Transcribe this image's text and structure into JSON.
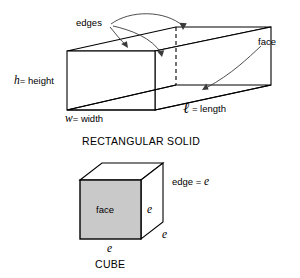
{
  "figure": {
    "colors": {
      "stroke": "#000000",
      "shaded_face": "#c9c9c9",
      "white_face": "#ffffff",
      "text": "#000000",
      "leader_line": "#3a3a3a"
    },
    "solid": {
      "title": "RECTANGULAR SOLID",
      "labels": {
        "edges": "edges",
        "face": "face",
        "height": "height",
        "height_var": "h",
        "height_eq": "=",
        "width": "width",
        "width_var": "w",
        "width_eq": "=",
        "length": "length",
        "length_var": "ℓ",
        "length_eq": "="
      }
    },
    "cube": {
      "title": "CUBE",
      "labels": {
        "face": "face",
        "edge_equals": "edge =",
        "edge_var": "e",
        "e_right": "e",
        "e_depth": "e",
        "e_bottom": "e"
      }
    }
  }
}
